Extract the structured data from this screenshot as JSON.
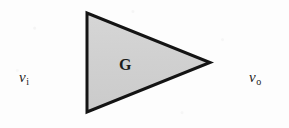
{
  "figure": {
    "name": "amplifier-block-diagram",
    "background_color": "#fdfdfd",
    "width": 289,
    "height": 128
  },
  "amplifier": {
    "symbol": "triangle",
    "gain_label": "G",
    "fill_color": "#d2d2d2",
    "stroke_color": "#141414",
    "stroke_width": 3,
    "apex_x": 211,
    "apex_y": 62,
    "left_x": 86,
    "top_y": 12,
    "bottom_y": 113
  },
  "wires": {
    "input": {
      "label_v": "v",
      "label_sub": "i",
      "x_start": 22,
      "x_end": 88,
      "y": 62,
      "stroke_color": "#2b2b2b",
      "stroke_width": 3
    },
    "output": {
      "label_v": "v",
      "label_sub": "o",
      "x_start": 210,
      "x_end": 272,
      "y": 62,
      "stroke_color": "#2b2b2b",
      "stroke_width": 3
    }
  }
}
